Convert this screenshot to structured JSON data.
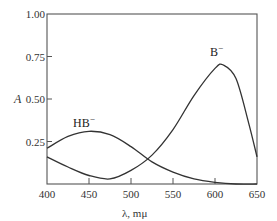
{
  "chart_data": {
    "type": "line",
    "title": "",
    "xlabel": "λ, mμ",
    "ylabel": "A",
    "xlim": [
      400,
      650
    ],
    "ylim": [
      0,
      1.0
    ],
    "x_ticks": [
      400,
      450,
      500,
      550,
      600,
      650
    ],
    "y_ticks": [
      0.25,
      0.5,
      0.75,
      1.0
    ],
    "x_tick_labels": [
      "400",
      "450",
      "500",
      "550",
      "600",
      "650"
    ],
    "y_tick_labels": [
      "0.25",
      "0.50",
      "0.75",
      "1.00"
    ],
    "grid": false,
    "legend": "inline labels",
    "series": [
      {
        "name": "HB⁻",
        "label": "HB",
        "superscript": "−",
        "x": [
          400,
          425,
          450,
          475,
          500,
          525,
          550,
          575,
          600,
          625,
          650
        ],
        "values": [
          0.21,
          0.28,
          0.31,
          0.29,
          0.22,
          0.13,
          0.07,
          0.03,
          0.01,
          0.0,
          0.0
        ]
      },
      {
        "name": "B⁻",
        "label": "B",
        "superscript": "−",
        "x": [
          400,
          425,
          450,
          475,
          500,
          525,
          550,
          575,
          600,
          610,
          625,
          640,
          650
        ],
        "values": [
          0.16,
          0.1,
          0.05,
          0.03,
          0.08,
          0.17,
          0.32,
          0.52,
          0.68,
          0.7,
          0.62,
          0.36,
          0.16
        ]
      }
    ]
  }
}
